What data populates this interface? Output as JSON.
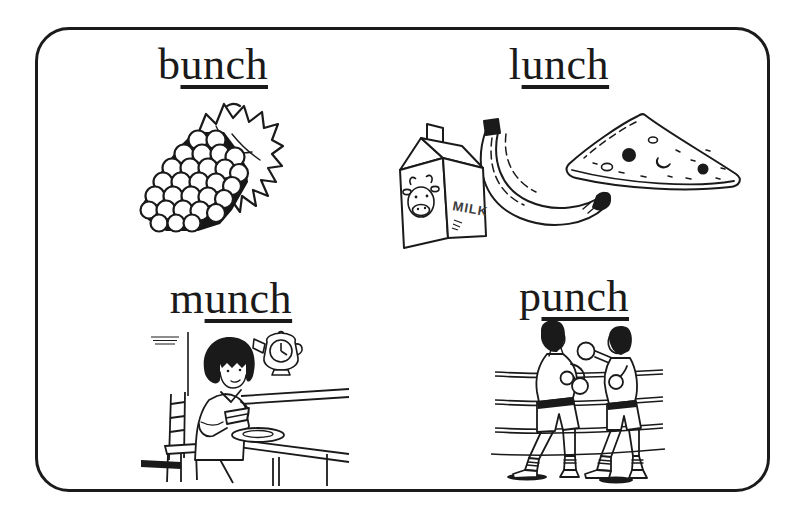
{
  "page": {
    "background": "#ffffff",
    "frame_border": "#1b1b1b",
    "ink": "#1a1a1a"
  },
  "cards": [
    {
      "word": "bunch",
      "onset": "b",
      "rime": "unch",
      "illustration": "bunch-of-grapes"
    },
    {
      "word": "lunch",
      "onset": "l",
      "rime": "unch",
      "illustration": "milk-carton-banana-pizza-slice"
    },
    {
      "word": "munch",
      "onset": "m",
      "rime": "unch",
      "illustration": "girl-munching-sandwich-at-table"
    },
    {
      "word": "punch",
      "onset": "p",
      "rime": "unch",
      "illustration": "two-boxers-punching-in-ring"
    }
  ],
  "labels": {
    "milk_carton": "MILK"
  }
}
